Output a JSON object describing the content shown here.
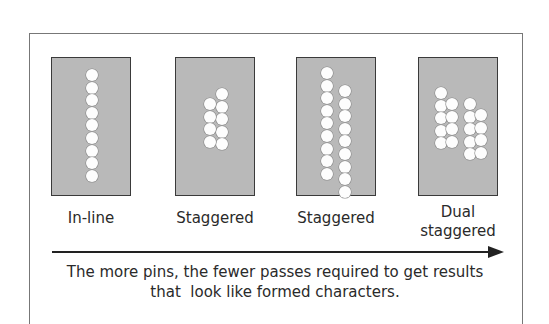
{
  "diagram": {
    "panels": [
      {
        "id": "inline",
        "label": "In-line",
        "pin_count": 9,
        "columns": [
          {
            "x": 40,
            "count": 9,
            "y0": 11
          }
        ]
      },
      {
        "id": "staggered-1",
        "label": "Staggered",
        "pin_count": 9,
        "columns": [
          {
            "x": 46,
            "count": 5,
            "y0": 30
          },
          {
            "x": 34,
            "count": 4,
            "y0": 40
          }
        ]
      },
      {
        "id": "staggered-2",
        "label": "Staggered",
        "pin_count": 18,
        "columns": [
          {
            "x": 30,
            "count": 9,
            "y0": 9
          },
          {
            "x": 48,
            "count": 9,
            "y0": 27
          }
        ]
      },
      {
        "id": "dual-staggered",
        "label_line1": "Dual",
        "label_line2": "staggered",
        "label": "Dual staggered",
        "pin_count": 18,
        "columns": [
          {
            "x": 22,
            "count": 5,
            "y0": 29
          },
          {
            "x": 33,
            "count": 4,
            "y0": 40
          },
          {
            "x": 51,
            "count": 5,
            "y0": 40
          },
          {
            "x": 62,
            "count": 4,
            "y0": 51
          }
        ]
      }
    ],
    "arrow": {
      "direction": "right",
      "meaning": "increasing pin count"
    },
    "caption_line1": "The more pins, the fewer passes required to get results",
    "caption_line2": "that  look like formed characters.",
    "colors": {
      "panel_fill": "#b9b9b9",
      "panel_border": "#3a3a3a",
      "pin": "#fdfdfd",
      "text": "#2a2a2a",
      "frame": "#777777"
    }
  }
}
